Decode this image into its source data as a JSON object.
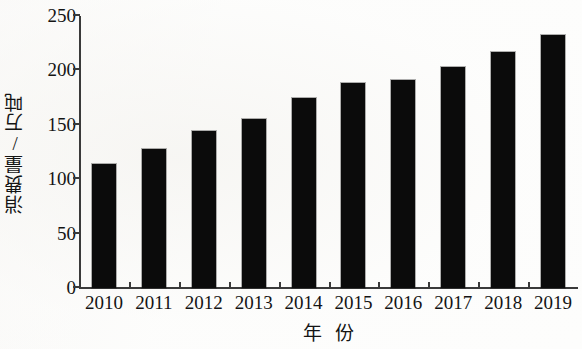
{
  "chart_data": {
    "type": "bar",
    "title": "",
    "subtitle": "",
    "xlabel": "年  份",
    "ylabel": "消费量/万吨",
    "categories": [
      "2010",
      "2011",
      "2012",
      "2013",
      "2014",
      "2015",
      "2016",
      "2017",
      "2018",
      "2019"
    ],
    "values": [
      114,
      128,
      144,
      155,
      175,
      188,
      191,
      203,
      217,
      233
    ],
    "series": [
      {
        "name": "消费量",
        "values": [
          114,
          128,
          144,
          155,
          175,
          188,
          191,
          203,
          217,
          233
        ]
      }
    ],
    "ylim": [
      0,
      250
    ],
    "yticks": [
      0,
      50,
      100,
      150,
      200,
      250
    ],
    "ytick_labels": [
      "0",
      "50",
      "100",
      "150",
      "200",
      "250"
    ],
    "xtick_labels": [
      "2010",
      "2011",
      "2012",
      "2013",
      "2014",
      "2015",
      "2016",
      "2017",
      "2018",
      "2019"
    ],
    "grid": false,
    "legend": false,
    "legend_position": "none",
    "bar_color": "#0b0b0b",
    "axis_color": "#3a3a3a",
    "background_color": "#ffffff",
    "annotations": []
  },
  "axis_titles": {
    "y": "消费量/万吨",
    "x_part1": "年",
    "x_part2": "份"
  }
}
